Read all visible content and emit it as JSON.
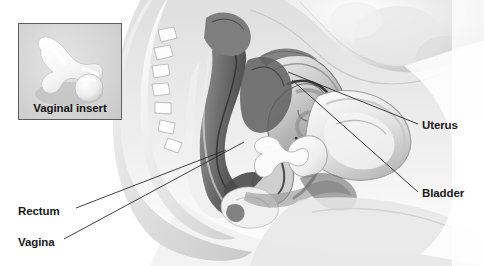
{
  "figure": {
    "type": "medical-illustration",
    "background_color": "#ffffff",
    "line_color": "#2b2b2b",
    "text_color": "#1a1a1a"
  },
  "inset": {
    "label": "Vaginal insert",
    "background_color": "#d9d9d9",
    "border_color": "#5d5d5d",
    "device_color": "#ffffff",
    "device_shape": "t-shaped-insert-with-ball"
  },
  "callouts": [
    {
      "id": "uterus",
      "label": "Uterus",
      "side": "right"
    },
    {
      "id": "bladder",
      "label": "Bladder",
      "side": "right"
    },
    {
      "id": "rectum",
      "label": "Rectum",
      "side": "left"
    },
    {
      "id": "vagina",
      "label": "Vagina",
      "side": "left"
    }
  ]
}
